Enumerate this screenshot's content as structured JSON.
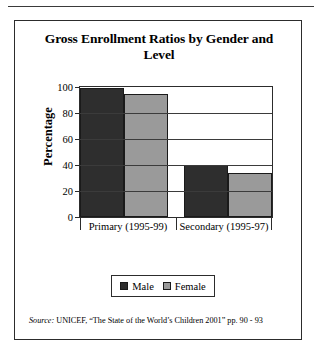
{
  "figure": {
    "title": "Gross Enrollment Ratios by Gender and Level",
    "source_label": "Source:",
    "source_text": " UNICEF, “The State of the World’s Children 2001” pp. 90 - 93"
  },
  "legend": {
    "items": [
      {
        "label": "Male",
        "color": "#2e2e2e"
      },
      {
        "label": "Female",
        "color": "#9a9a9a"
      }
    ]
  },
  "colors": {
    "male": "#2e2e2e",
    "female": "#9a9a9a",
    "axis": "#2c2c2c",
    "frame": "#2c2c2c",
    "background": "#ffffff"
  },
  "chart_data": {
    "type": "bar",
    "title": "Gross Enrollment Ratios by Gender and Level",
    "xlabel": "",
    "ylabel": "Percentage",
    "categories": [
      "Primary (1995-99)",
      "Secondary (1995-97)"
    ],
    "series": [
      {
        "name": "Male",
        "values": [
          99,
          40
        ],
        "color": "#2e2e2e"
      },
      {
        "name": "Female",
        "values": [
          95,
          34
        ],
        "color": "#9a9a9a"
      }
    ],
    "ylim": [
      0,
      100
    ],
    "yticks": [
      0,
      20,
      40,
      60,
      80,
      100
    ],
    "ytick_labels": [
      "0",
      "20",
      "40",
      "60",
      "80",
      "100"
    ],
    "grid": true,
    "legend_position": "bottom",
    "annotations": [
      "Source: UNICEF, “The State of the World’s Children 2001” pp. 90 - 93"
    ]
  }
}
